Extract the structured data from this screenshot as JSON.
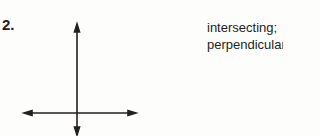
{
  "problem": {
    "number": "2.",
    "answer_line1": "intersecting;",
    "answer_line2": "perpendicular"
  },
  "figure": {
    "vertical_line": {
      "x": 77,
      "y1": 24,
      "y2": 134
    },
    "horizontal_line": {
      "y": 113,
      "x1": 25,
      "x2": 135
    }
  }
}
